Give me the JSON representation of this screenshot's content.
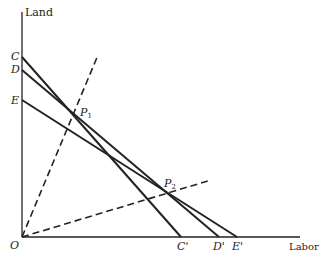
{
  "diagram": {
    "type": "isoquant-cost-lines",
    "axes": {
      "y_label": "Land",
      "x_label": "Labor",
      "origin_label": "O"
    },
    "budget_lines": [
      {
        "name": "CC'",
        "start_label": "C",
        "end_label": "C'",
        "style": "solid"
      },
      {
        "name": "DD'",
        "start_label": "D",
        "end_label": "D'",
        "style": "solid"
      },
      {
        "name": "EE'",
        "start_label": "E",
        "end_label": "E'",
        "style": "solid"
      }
    ],
    "expansion_rays": [
      {
        "name": "ray-1",
        "style": "dashed",
        "point_label": "P",
        "point_sub": "1"
      },
      {
        "name": "ray-2",
        "style": "dashed",
        "point_label": "P",
        "point_sub": "2"
      }
    ],
    "colors": {
      "ink": "#222222",
      "background": "#ffffff"
    }
  }
}
